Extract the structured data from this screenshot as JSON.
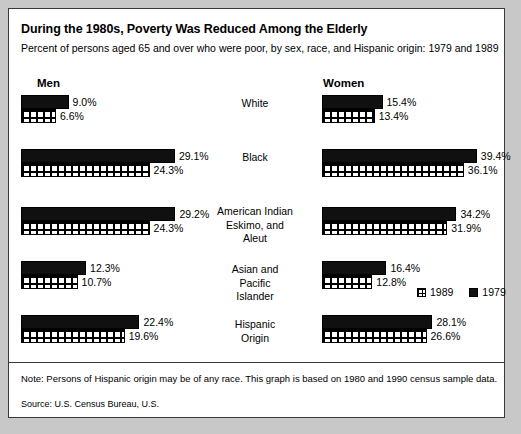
{
  "title": "During the 1980s, Poverty Was Reduced Among the Elderly",
  "subtitle": "Percent of persons aged 65 and over who were poor, by sex, race, and Hispanic origin:  1979 and 1989",
  "panels": {
    "men": "Men",
    "women": "Women"
  },
  "legend": {
    "items": [
      {
        "label": "1989",
        "swatch": "mesh-grid"
      },
      {
        "label": "1979",
        "swatch": "solid-black"
      }
    ]
  },
  "note": "Note:  Persons of Hispanic origin may be of any race. This graph is based on 1980 and 1990 census sample data.",
  "source": "Source:  U.S. Census Bureau, U.S.",
  "chart_data": {
    "type": "bar",
    "title": "During the 1980s, Poverty Was Reduced Among the Elderly",
    "subtitle": "Percent of persons aged 65 and over who were poor, by sex, race, and Hispanic origin:  1979 and 1989",
    "orientation": "horizontal",
    "xlabel": "",
    "ylabel": "",
    "grid": false,
    "legend_position": "middle-right",
    "panels": [
      "Men",
      "Women"
    ],
    "categories": [
      "White",
      "Black",
      "American Indian\nEskimo, and\nAleut",
      "Asian and\nPacific\nIslander",
      "Hispanic\nOrigin"
    ],
    "series": [
      {
        "name": "1979",
        "panel": "Men",
        "values": [
          9.0,
          29.1,
          29.2,
          12.3,
          22.4
        ]
      },
      {
        "name": "1989",
        "panel": "Men",
        "values": [
          6.6,
          24.3,
          24.3,
          10.7,
          19.6
        ]
      },
      {
        "name": "1979",
        "panel": "Women",
        "values": [
          15.4,
          39.4,
          34.2,
          16.4,
          28.1
        ]
      },
      {
        "name": "1989",
        "panel": "Women",
        "values": [
          13.4,
          36.1,
          31.9,
          12.8,
          26.6
        ]
      }
    ],
    "value_labels": {
      "men": {
        "1979": [
          "9.0%",
          "29.1%",
          "29.2%",
          "12.3%",
          "22.4%"
        ],
        "1989": [
          "6.6%",
          "24.3%",
          "24.3%",
          "10.7%",
          "19.6%"
        ]
      },
      "women": {
        "1979": [
          "15.4%",
          "39.4%",
          "34.2%",
          "16.4%",
          "28.1%"
        ],
        "1989": [
          "13.4%",
          "36.1%",
          "31.9%",
          "12.8%",
          "26.6%"
        ]
      }
    },
    "xlim": [
      0,
      40
    ]
  }
}
